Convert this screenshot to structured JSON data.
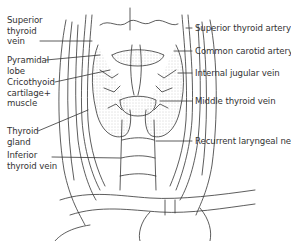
{
  "figure": {
    "colors": {
      "ink": "#333333",
      "shade": "#bdbdbd",
      "background": "#ffffff"
    }
  },
  "labels_left": [
    {
      "id": "superior-thyroid-vein",
      "lines": [
        "Superior",
        "thyroid",
        "vein"
      ]
    },
    {
      "id": "pyramidal-lobe",
      "lines": [
        "Pyramidal",
        "lobe"
      ]
    },
    {
      "id": "cricothyoid",
      "lines": [
        "Cricothyoid",
        "cartilage+",
        "muscle"
      ]
    },
    {
      "id": "thyroid-gland",
      "lines": [
        "Thyroid",
        "gland"
      ]
    },
    {
      "id": "inferior-thyroid-vein",
      "lines": [
        "Inferior",
        "thyroid vein"
      ]
    }
  ],
  "labels_right": [
    {
      "id": "superior-thyroid-artery",
      "text": "Superior thyroid artery"
    },
    {
      "id": "common-carotid-artery",
      "text": "Common carotid artery"
    },
    {
      "id": "internal-jugular-vein",
      "text": "Internal jugular vein"
    },
    {
      "id": "middle-thyroid-vein",
      "text": "Middle thyroid vein"
    },
    {
      "id": "recurrent-laryngeal-nerve",
      "text": "Recurrent laryngeal nerve"
    }
  ]
}
